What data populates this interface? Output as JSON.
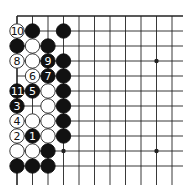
{
  "diagram": {
    "grid": {
      "origin_x": 17,
      "origin_y": 16,
      "spacing_x": 15.5,
      "spacing_y": 15,
      "columns": 11,
      "rows": 11,
      "right_extent": 183,
      "bottom_extent": 185,
      "line_color": "#222222",
      "edge_top": true,
      "edge_left": true
    },
    "star_points": [
      {
        "col": 3,
        "row": 9
      },
      {
        "col": 9,
        "row": 3
      },
      {
        "col": 9,
        "row": 9
      }
    ],
    "stones": [
      {
        "col": 0,
        "row": 1,
        "color": "white",
        "label": "10"
      },
      {
        "col": 1,
        "row": 1,
        "color": "black",
        "label": ""
      },
      {
        "col": 3,
        "row": 1,
        "color": "black",
        "label": ""
      },
      {
        "col": 0,
        "row": 2,
        "color": "black",
        "label": ""
      },
      {
        "col": 1,
        "row": 2,
        "color": "white",
        "label": ""
      },
      {
        "col": 2,
        "row": 2,
        "color": "black",
        "label": ""
      },
      {
        "col": 0,
        "row": 3,
        "color": "white",
        "label": "8"
      },
      {
        "col": 1,
        "row": 3,
        "color": "white",
        "label": ""
      },
      {
        "col": 2,
        "row": 3,
        "color": "black",
        "label": "9"
      },
      {
        "col": 3,
        "row": 3,
        "color": "black",
        "label": ""
      },
      {
        "col": 1,
        "row": 4,
        "color": "white",
        "label": "6"
      },
      {
        "col": 2,
        "row": 4,
        "color": "black",
        "label": "7"
      },
      {
        "col": 3,
        "row": 4,
        "color": "black",
        "label": ""
      },
      {
        "col": 0,
        "row": 5,
        "color": "black",
        "label": "11"
      },
      {
        "col": 1,
        "row": 5,
        "color": "black",
        "label": "5"
      },
      {
        "col": 2,
        "row": 5,
        "color": "white",
        "label": ""
      },
      {
        "col": 3,
        "row": 5,
        "color": "black",
        "label": ""
      },
      {
        "col": 0,
        "row": 6,
        "color": "black",
        "label": "3"
      },
      {
        "col": 2,
        "row": 6,
        "color": "white",
        "label": ""
      },
      {
        "col": 3,
        "row": 6,
        "color": "black",
        "label": ""
      },
      {
        "col": 0,
        "row": 7,
        "color": "white",
        "label": "4"
      },
      {
        "col": 1,
        "row": 7,
        "color": "white",
        "label": ""
      },
      {
        "col": 2,
        "row": 7,
        "color": "white",
        "label": ""
      },
      {
        "col": 3,
        "row": 7,
        "color": "black",
        "label": ""
      },
      {
        "col": 0,
        "row": 8,
        "color": "white",
        "label": "2"
      },
      {
        "col": 1,
        "row": 8,
        "color": "black",
        "label": "1"
      },
      {
        "col": 2,
        "row": 8,
        "color": "white",
        "label": ""
      },
      {
        "col": 3,
        "row": 8,
        "color": "black",
        "label": ""
      },
      {
        "col": 0,
        "row": 9,
        "color": "white",
        "label": ""
      },
      {
        "col": 1,
        "row": 9,
        "color": "white",
        "label": ""
      },
      {
        "col": 2,
        "row": 9,
        "color": "black",
        "label": ""
      },
      {
        "col": 0,
        "row": 10,
        "color": "black",
        "label": ""
      },
      {
        "col": 1,
        "row": 10,
        "color": "black",
        "label": ""
      },
      {
        "col": 2,
        "row": 10,
        "color": "black",
        "label": ""
      }
    ],
    "colors": {
      "black_stone": "#111111",
      "white_stone": "#ffffff",
      "white_stone_outline": "#222222",
      "black_label": "#ffffff",
      "white_label": "#111111",
      "background": "#ffffff"
    }
  }
}
